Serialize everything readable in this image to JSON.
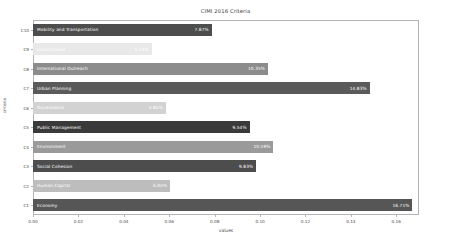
{
  "chart_data": {
    "type": "bar",
    "orientation": "horizontal",
    "title": "CIMI 2016 Criteria",
    "xlabel": "values",
    "ylabel": "criteria",
    "xlim": [
      0.0,
      0.17
    ],
    "xticks": [
      "0.00",
      "0.02",
      "0.04",
      "0.06",
      "0.08",
      "0.10",
      "0.12",
      "0.14",
      "0.16"
    ],
    "xtick_values": [
      0.0,
      0.02,
      0.04,
      0.06,
      0.08,
      0.1,
      0.12,
      0.14,
      0.16
    ],
    "grid": false,
    "legend": "none",
    "categories": [
      "C10",
      "C9",
      "C8",
      "C7",
      "C6",
      "C5",
      "C4",
      "C3",
      "C2",
      "C1"
    ],
    "bars": [
      {
        "tick": "C10",
        "name": "Mobility and Transportation",
        "value": 0.0787,
        "label": "7.87%",
        "color": "#4d4d4d"
      },
      {
        "tick": "C9",
        "name": "Environment",
        "value": 0.0523,
        "label": "5.23%",
        "color": "#e8e8e8"
      },
      {
        "tick": "C8",
        "name": "International Outreach",
        "value": 0.1035,
        "label": "10.35%",
        "color": "#8c8c8c"
      },
      {
        "tick": "C7",
        "name": "Urban Planning",
        "value": 0.1483,
        "label": "14.83%",
        "color": "#5a5a5a"
      },
      {
        "tick": "C6",
        "name": "Governance",
        "value": 0.0585,
        "label": "5.85%",
        "color": "#d2d2d2"
      },
      {
        "tick": "C5",
        "name": "Public Management",
        "value": 0.0954,
        "label": "9.54%",
        "color": "#3a3a3a"
      },
      {
        "tick": "C4",
        "name": "Environment",
        "value": 0.1059,
        "label": "10.59%",
        "color": "#9a9a9a"
      },
      {
        "tick": "C3",
        "name": "Social Cohesion",
        "value": 0.0983,
        "label": "9.83%",
        "color": "#4d4d4d"
      },
      {
        "tick": "C2",
        "name": "Human Capital",
        "value": 0.0604,
        "label": "6.04%",
        "color": "#bdbdbd"
      },
      {
        "tick": "C1",
        "name": "Economy",
        "value": 0.1671,
        "label": "16.71%",
        "color": "#565656"
      }
    ]
  }
}
